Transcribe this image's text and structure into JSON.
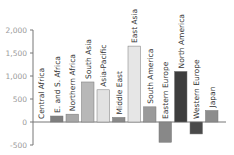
{
  "chart_data": {
    "type": "bar",
    "title": "",
    "xlabel": "",
    "ylabel": "",
    "ylim": [
      -500,
      2000
    ],
    "yticks": [
      2000,
      1500,
      1000,
      500,
      0,
      -500
    ],
    "ytick_labels": [
      "2,000",
      "1,500",
      "1,000",
      "500",
      "0",
      "-500"
    ],
    "grid": false,
    "legend": null,
    "categories": [
      "Central Africa",
      "E. and S. Africa",
      "Northern Africa",
      "South Asia",
      "Asia-Pacific",
      "Middle East",
      "East Asia",
      "South America",
      "Eastern Europe",
      "North America",
      "Western Europe",
      "Japan"
    ],
    "values": [
      0,
      130,
      170,
      870,
      700,
      100,
      1650,
      330,
      -440,
      1100,
      -260,
      250
    ],
    "colors": [
      "#888888",
      "#7f7f7f",
      "#a8a8a8",
      "#b8b8b8",
      "#e2e2e2",
      "#8a8a8a",
      "#e6e6e6",
      "#9a9a9a",
      "#888888",
      "#3d3d3d",
      "#4a4a4a",
      "#8c8c8c"
    ]
  }
}
